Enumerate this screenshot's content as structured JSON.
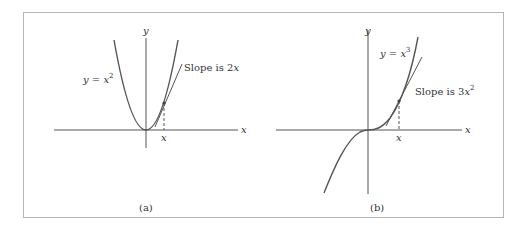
{
  "figure": {
    "frame_color": "#b5b5b5",
    "stroke_color": "#555555",
    "panels": [
      {
        "id": "a",
        "caption": "(a)",
        "axis_x_label": "x",
        "axis_y_label": "y",
        "curve_label": "y = x²",
        "curve_label_parts": {
          "lhs": "y = x",
          "sup": "2"
        },
        "tangent_label": "Slope is 2x",
        "tangent_label_parts": {
          "text": "Slope is 2",
          "var": "x",
          "sup": ""
        },
        "point_label": "x"
      },
      {
        "id": "b",
        "caption": "(b)",
        "axis_x_label": "x",
        "axis_y_label": "y",
        "curve_label": "y = x³",
        "curve_label_parts": {
          "lhs": "y = x",
          "sup": "3"
        },
        "tangent_label": "Slope is 3x²",
        "tangent_label_parts": {
          "text": "Slope is 3",
          "var": "x",
          "sup": "2"
        },
        "point_label": "x"
      }
    ]
  }
}
